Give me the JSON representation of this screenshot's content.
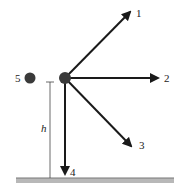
{
  "diagram": {
    "labels": {
      "arrow1": "1",
      "arrow2": "2",
      "arrow3": "3",
      "arrow4": "4",
      "ball5": "5",
      "height": "h"
    },
    "colors": {
      "ball": "#3a3a3a",
      "arrow": "#1a1a1a",
      "ground_fill": "#b8b8b8",
      "ground_line": "#777777",
      "dimension_line": "#444444"
    }
  }
}
